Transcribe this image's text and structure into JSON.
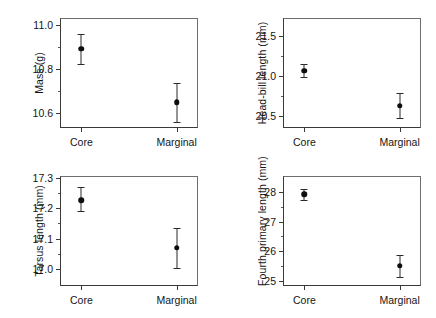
{
  "figure": {
    "background": "#ffffff",
    "marker_color": "#0d0d0d",
    "axis_color": "#3a3a3a",
    "caption_partial": ""
  },
  "chart_data": [
    {
      "type": "scatter",
      "panel": "A",
      "title": "",
      "xlabel": "",
      "ylabel": "Mass (g)",
      "categories": [
        "Core",
        "Marginal"
      ],
      "values": [
        10.89,
        10.647
      ],
      "error_low": [
        10.822,
        10.558
      ],
      "error_high": [
        10.958,
        10.735
      ],
      "error_type": "95% confidence interval",
      "ylim": [
        10.53,
        11.03
      ],
      "yticks": [
        10.6,
        10.8,
        11.0
      ],
      "ytick_labels": [
        "10.6",
        "10.8",
        "11.0"
      ],
      "yminor_ticks": [
        10.7,
        10.9
      ],
      "grid": false,
      "legend": "none"
    },
    {
      "type": "scatter",
      "panel": "B",
      "title": "",
      "xlabel": "",
      "ylabel": "Head-bill length (mm)",
      "categories": [
        "Core",
        "Marginal"
      ],
      "values": [
        21.068,
        20.632
      ],
      "error_low": [
        20.992,
        20.472
      ],
      "error_high": [
        21.148,
        20.792
      ],
      "error_type": "95% confidence interval",
      "ylim": [
        20.35,
        21.73
      ],
      "yticks": [
        20.5,
        21.0,
        21.5
      ],
      "ytick_labels": [
        "20.5",
        "21.0",
        "21.5"
      ],
      "yminor_ticks": [
        20.75,
        21.25
      ],
      "grid": false,
      "legend": "none"
    },
    {
      "type": "scatter",
      "panel": "C",
      "title": "",
      "xlabel": "",
      "ylabel": "Tarsus length (mm)",
      "categories": [
        "Core",
        "Marginal"
      ],
      "values": [
        17.225,
        17.07
      ],
      "error_low": [
        17.189,
        17.003
      ],
      "error_high": [
        17.268,
        17.134
      ],
      "error_type": "95% confidence interval",
      "ylim": [
        16.945,
        17.305
      ],
      "yticks": [
        17.0,
        17.1,
        17.2,
        17.3
      ],
      "ytick_labels": [
        "17.0",
        "17.1",
        "17.2",
        "17.3"
      ],
      "yminor_ticks": [
        17.05,
        17.15,
        17.25
      ],
      "grid": false,
      "legend": "none"
    },
    {
      "type": "scatter",
      "panel": "D",
      "title": "",
      "xlabel": "",
      "ylabel": "Fourth primary length (mm)",
      "categories": [
        "Core",
        "Marginal"
      ],
      "values": [
        27.93,
        25.5
      ],
      "error_low": [
        27.74,
        25.12
      ],
      "error_high": [
        28.1,
        25.88
      ],
      "error_type": "95% confidence interval",
      "ylim": [
        24.82,
        28.55
      ],
      "yticks": [
        25,
        26,
        27,
        28
      ],
      "ytick_labels": [
        "25",
        "26",
        "27",
        "28"
      ],
      "yminor_ticks": [
        25.5,
        26.5,
        27.5
      ],
      "grid": false,
      "legend": "none"
    }
  ]
}
